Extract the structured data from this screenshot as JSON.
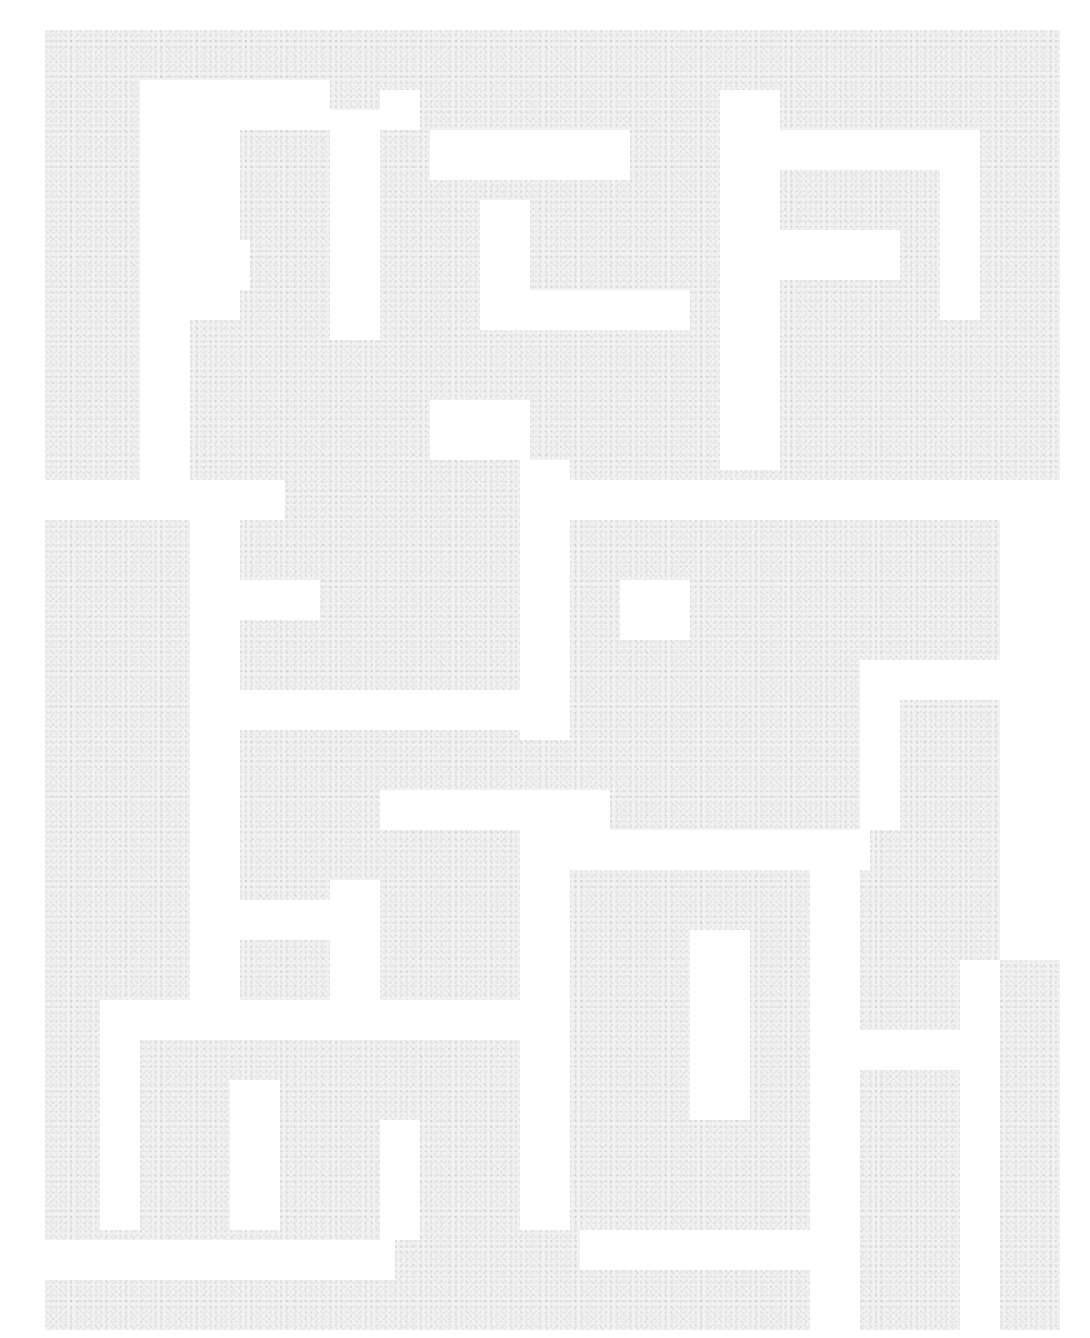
{
  "image": {
    "description": "Faint gray speckled noise texture arranged in a maze-like pattern of rectangular blocks on a white background; no text or UI elements visible",
    "background_color": "#ffffff",
    "block_color": "#efefef",
    "texture": "speckled-noise"
  }
}
